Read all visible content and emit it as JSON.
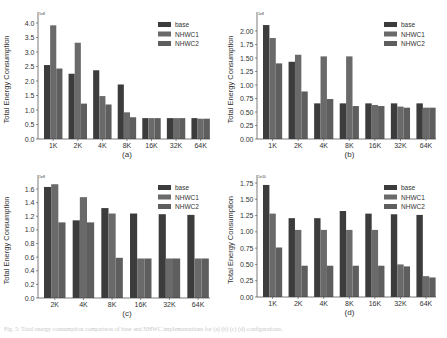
{
  "colors": {
    "base": "#3c3c3c",
    "NHWC1": "#6a6a6a",
    "NHWC2": "#5e5e5e",
    "axis": "#444444"
  },
  "chart_data": [
    {
      "id": "a",
      "type": "bar",
      "title": "",
      "xlabel": "(a)",
      "ylabel": "Total Energy Consumption",
      "exponent_label": "1e8",
      "categories": [
        "1K",
        "2K",
        "4K",
        "8K",
        "16K",
        "32K",
        "64K"
      ],
      "series": [
        {
          "name": "base",
          "values": [
            2.55,
            2.25,
            2.37,
            1.88,
            0.72,
            0.72,
            0.72
          ]
        },
        {
          "name": "NHWC1",
          "values": [
            3.92,
            3.32,
            1.48,
            0.92,
            0.72,
            0.72,
            0.7
          ]
        },
        {
          "name": "NHWC2",
          "values": [
            2.43,
            1.22,
            1.19,
            0.75,
            0.72,
            0.72,
            0.7
          ]
        }
      ],
      "ylim": [
        0,
        4.1
      ],
      "yticks": [
        0.0,
        0.5,
        1.0,
        1.5,
        2.0,
        2.5,
        3.0,
        3.5,
        4.0
      ],
      "ytick_labels": [
        "0.0",
        "0.5",
        "1.0",
        "1.5",
        "2.0",
        "2.5",
        "3.0",
        "3.5",
        "4.0"
      ],
      "grid": false,
      "legend_position": "upper right"
    },
    {
      "id": "b",
      "type": "bar",
      "title": "",
      "xlabel": "(b)",
      "ylabel": "Total Energy Consumption",
      "exponent_label": "1e8",
      "categories": [
        "1K",
        "2K",
        "4K",
        "8K",
        "16K",
        "32K",
        "64K"
      ],
      "series": [
        {
          "name": "base",
          "values": [
            2.11,
            1.43,
            0.66,
            0.66,
            0.66,
            0.66,
            0.66
          ]
        },
        {
          "name": "NHWC1",
          "values": [
            1.87,
            1.56,
            1.53,
            1.53,
            0.63,
            0.6,
            0.58
          ]
        },
        {
          "name": "NHWC2",
          "values": [
            1.4,
            0.88,
            0.74,
            0.61,
            0.61,
            0.58,
            0.58
          ]
        }
      ],
      "ylim": [
        0,
        2.2
      ],
      "yticks": [
        0.0,
        0.25,
        0.5,
        0.75,
        1.0,
        1.25,
        1.5,
        1.75,
        2.0
      ],
      "ytick_labels": [
        "0.00",
        "0.25",
        "0.50",
        "0.75",
        "1.00",
        "1.25",
        "1.50",
        "1.75",
        "2.00"
      ],
      "grid": false,
      "legend_position": "upper right"
    },
    {
      "id": "c",
      "type": "bar",
      "title": "",
      "xlabel": "(c)",
      "ylabel": "Total Energy Consumption",
      "exponent_label": "1e8",
      "categories": [
        "2K",
        "4K",
        "8K",
        "16K",
        "32K",
        "64K"
      ],
      "series": [
        {
          "name": "base",
          "values": [
            1.63,
            1.14,
            1.32,
            1.24,
            1.23,
            1.22
          ]
        },
        {
          "name": "NHWC1",
          "values": [
            1.67,
            1.48,
            1.24,
            0.58,
            0.58,
            0.58
          ]
        },
        {
          "name": "NHWC2",
          "values": [
            1.11,
            1.11,
            0.59,
            0.58,
            0.58,
            0.58
          ]
        }
      ],
      "ylim": [
        0,
        1.75
      ],
      "yticks": [
        0.0,
        0.2,
        0.4,
        0.6,
        0.8,
        1.0,
        1.2,
        1.4,
        1.6
      ],
      "ytick_labels": [
        "0.0",
        "0.2",
        "0.4",
        "0.6",
        "0.8",
        "1.0",
        "1.2",
        "1.4",
        "1.6"
      ],
      "grid": false,
      "legend_position": "upper right"
    },
    {
      "id": "d",
      "type": "bar",
      "title": "",
      "xlabel": "(d)",
      "ylabel": "Total Energy Consumption",
      "exponent_label": "1e10",
      "categories": [
        "1K",
        "2K",
        "4K",
        "8K",
        "16K",
        "32K",
        "64K"
      ],
      "series": [
        {
          "name": "base",
          "values": [
            1.72,
            1.21,
            1.21,
            1.32,
            1.28,
            1.27,
            1.26
          ]
        },
        {
          "name": "NHWC1",
          "values": [
            1.28,
            1.03,
            1.03,
            1.03,
            1.03,
            0.5,
            0.32
          ]
        },
        {
          "name": "NHWC2",
          "values": [
            0.76,
            0.48,
            0.48,
            0.48,
            0.48,
            0.47,
            0.3
          ]
        }
      ],
      "ylim": [
        0,
        1.82
      ],
      "yticks": [
        0.0,
        0.25,
        0.5,
        0.75,
        1.0,
        1.25,
        1.5,
        1.75
      ],
      "ytick_labels": [
        "0.00",
        "0.25",
        "0.50",
        "0.75",
        "1.00",
        "1.25",
        "1.50",
        "1.75"
      ],
      "grid": false,
      "legend_position": "upper right"
    }
  ],
  "panels": [
    {
      "left": 0,
      "top": 0,
      "axisX": 38,
      "axisTop": 12,
      "baseY": 139,
      "plotRight": 210,
      "tickTopY": 23,
      "tickTopVal": 4.0
    },
    {
      "left": 224,
      "top": 0,
      "axisX": 33,
      "axisTop": 12,
      "baseY": 139,
      "plotRight": 212,
      "tickTopY": 31,
      "tickTopVal": 2.0
    },
    {
      "left": 0,
      "top": 165,
      "axisX": 38,
      "axisTop": 10,
      "baseY": 133,
      "plotRight": 210,
      "tickTopY": 24,
      "tickTopVal": 1.6
    },
    {
      "left": 224,
      "top": 165,
      "axisX": 33,
      "axisTop": 10,
      "baseY": 132,
      "plotRight": 212,
      "tickTopY": 18,
      "tickTopVal": 1.75
    }
  ],
  "caption": "Fig. 5: Total energy consumption comparison of base and NHWC implementations for (a) (b) (c) (d) configurations."
}
